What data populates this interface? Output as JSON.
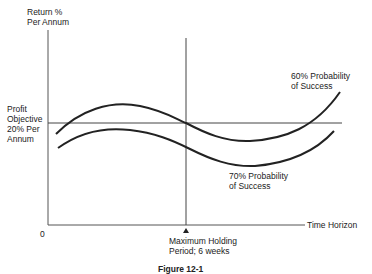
{
  "diagram": {
    "y_axis_label": [
      "Return %",
      "Per Annum"
    ],
    "x_axis_label": "Time Horizon",
    "origin_label": "0",
    "reference_line_label": [
      "Profit",
      "Objective",
      "20% Per",
      "Annum"
    ],
    "marker_label": [
      "Maximum Holding",
      "Period;  6 weeks"
    ],
    "curves": [
      {
        "name": "upper",
        "label": [
          "60% Probability",
          "of Success"
        ]
      },
      {
        "name": "lower",
        "label": [
          "70% Probability",
          "of Success"
        ]
      }
    ],
    "caption": "Figure 12-1"
  },
  "colors": {
    "line": "#2a2a2a",
    "axis": "#555555",
    "text": "#222222"
  }
}
